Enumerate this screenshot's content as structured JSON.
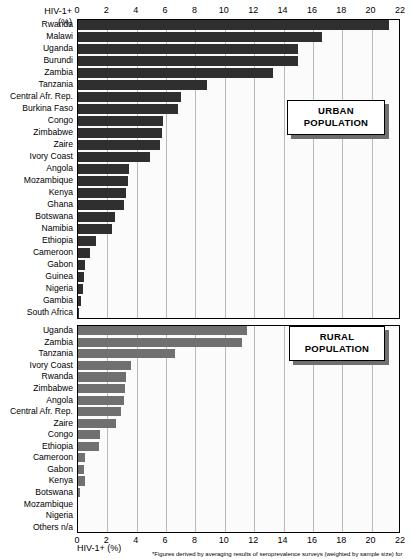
{
  "chart_data": {
    "type": "bar",
    "orientation": "horizontal",
    "title": "",
    "xlabel": "HIV-1+ (%)",
    "ylabel": "",
    "xlim": [
      0,
      22
    ],
    "xticks": [
      0,
      2,
      4,
      6,
      8,
      10,
      12,
      14,
      16,
      18,
      20,
      22
    ],
    "grid": "vertical",
    "legend_position": "inside-right",
    "axis_label_top_line1": "HIV-1+",
    "axis_label_top_line2": "(%)",
    "axis_label_bottom": "HIV-1+  (%)",
    "footnote": "*Figures derived by averaging results of seroprevalence surveys (weighted by sample size) for",
    "panels": [
      {
        "key": "urban",
        "legend_line1": "URBAN",
        "legend_line2": "POPULATION",
        "bar_color": "#2f2f2f",
        "categories": [
          "Rwanda",
          "Malawi",
          "Uganda",
          "Burundi",
          "Zambia",
          "Tanzania",
          "Central Afr. Rep.",
          "Burkina Faso",
          "Congo",
          "Zimbabwe",
          "Zaire",
          "Ivory Coast",
          "Angola",
          "Mozambique",
          "Kenya",
          "Ghana",
          "Botswana",
          "Namibia",
          "Ethiopia",
          "Cameroon",
          "Gabon",
          "Guinea",
          "Nigeria",
          "Gambia",
          "South Africa"
        ],
        "values": [
          21.2,
          16.6,
          15.0,
          15.0,
          13.3,
          8.8,
          7.0,
          6.8,
          5.8,
          5.7,
          5.6,
          4.9,
          3.5,
          3.4,
          3.3,
          3.1,
          2.5,
          2.3,
          1.2,
          0.8,
          0.5,
          0.4,
          0.35,
          0.2,
          0.05
        ]
      },
      {
        "key": "rural",
        "legend_line1": "RURAL",
        "legend_line2": "POPULATION",
        "bar_color": "#707070",
        "categories": [
          "Uganda",
          "Zambia",
          "Tanzania",
          "Ivory Coast",
          "Rwanda",
          "Zimbabwe",
          "Angola",
          "Central Afr. Rep.",
          "Zaire",
          "Congo",
          "Ethiopia",
          "Cameroon",
          "Gabon",
          "Kenya",
          "Botswana",
          "Mozambique",
          "Nigeria",
          "Others n/a"
        ],
        "values": [
          11.5,
          11.2,
          6.6,
          3.6,
          3.3,
          3.2,
          3.1,
          2.9,
          2.6,
          1.5,
          1.4,
          0.5,
          0.4,
          0.5,
          0.12,
          0.0,
          0.0,
          0.0
        ]
      }
    ]
  }
}
